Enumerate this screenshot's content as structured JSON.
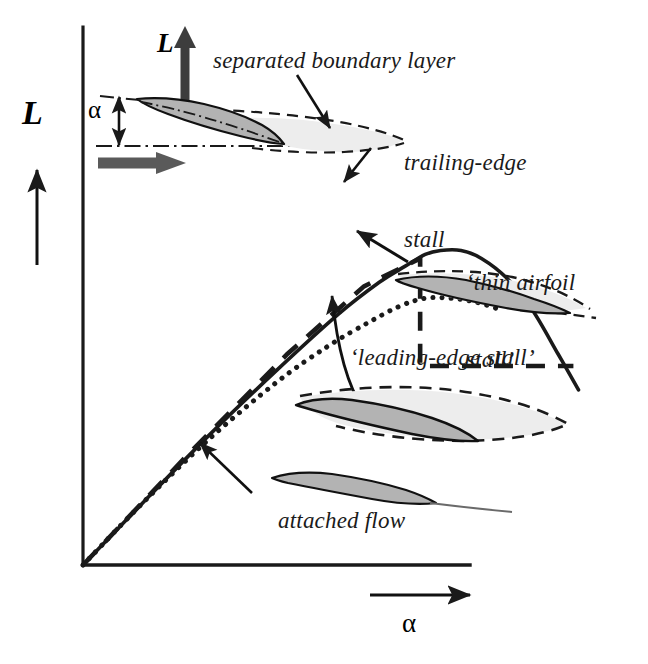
{
  "figure": {
    "background_color": "#ffffff",
    "ink_color": "#1a1a1a",
    "airfoil_fill_color": "#b3b3b3",
    "separation_fill_color": "#ededed"
  },
  "axes": {
    "y_label": "L",
    "x_label": "α",
    "y_axis_name": "lift",
    "x_axis_name": "angle of attack",
    "origin_px": [
      83,
      565
    ],
    "y_axis_top_px": [
      83,
      27
    ],
    "x_axis_right_px": [
      470,
      565
    ],
    "grid": "off",
    "ticks": "none"
  },
  "annotations": {
    "separated_boundary_layer": "separated boundary layer",
    "trailing_edge_stall_line1": "trailing-edge",
    "trailing_edge_stall_line2": "stall",
    "thin_airfoil_stall_line1": "‘thin airfoil",
    "thin_airfoil_stall_line2": "stall’",
    "leading_edge_stall": "‘leading-edge stall’",
    "attached_flow": "attached flow",
    "inset_lift_label": "L",
    "inset_alpha_label": "α"
  },
  "chart_data": {
    "type": "line",
    "xlabel": "α",
    "ylabel": "L",
    "xlim": [
      0,
      1
    ],
    "ylim": [
      0,
      1
    ],
    "grid": false,
    "legend_position": "inline-annotations",
    "note": "Normalized units; curves share a common linear lift slope then diverge at stall.",
    "series": [
      {
        "name": "trailing-edge stall",
        "style": "solid",
        "color": "#1a1a1a",
        "x": [
          0.0,
          0.12,
          0.25,
          0.38,
          0.5,
          0.58,
          0.63,
          0.67,
          0.7,
          0.74,
          0.78,
          0.83,
          0.88,
          0.93,
          0.97
        ],
        "y": [
          0.0,
          0.16,
          0.33,
          0.49,
          0.63,
          0.71,
          0.75,
          0.78,
          0.79,
          0.79,
          0.77,
          0.72,
          0.64,
          0.53,
          0.44
        ]
      },
      {
        "name": "thin airfoil stall",
        "style": "dotted",
        "color": "#1a1a1a",
        "x": [
          0.0,
          0.12,
          0.25,
          0.38,
          0.48,
          0.56,
          0.62,
          0.67,
          0.72,
          0.77,
          0.82
        ],
        "y": [
          0.0,
          0.16,
          0.32,
          0.46,
          0.55,
          0.61,
          0.65,
          0.67,
          0.67,
          0.66,
          0.64
        ]
      },
      {
        "name": "leading-edge stall",
        "style": "dashed",
        "color": "#1a1a1a",
        "x": [
          0.0,
          0.2,
          0.4,
          0.55,
          0.66,
          0.66,
          0.72,
          0.8,
          0.88,
          0.96
        ],
        "y": [
          0.0,
          0.27,
          0.53,
          0.7,
          0.77,
          0.5,
          0.5,
          0.5,
          0.5,
          0.5
        ],
        "note": "abrupt vertical lift drop at stall, then flat plateau"
      }
    ]
  },
  "diagram_elements": {
    "inset_airfoil": "inclined airfoil with angle of attack alpha, lift arrow and freestream arrow",
    "trailing_edge_airfoil": "airfoil with separated region growing from trailing edge",
    "thin_airfoil": "thin airfoil with separation bubble over whole chord",
    "leading_edge_airfoil": "airfoil with large separated wake from leading edge",
    "attached_airfoil": "airfoil with fully attached flow"
  }
}
